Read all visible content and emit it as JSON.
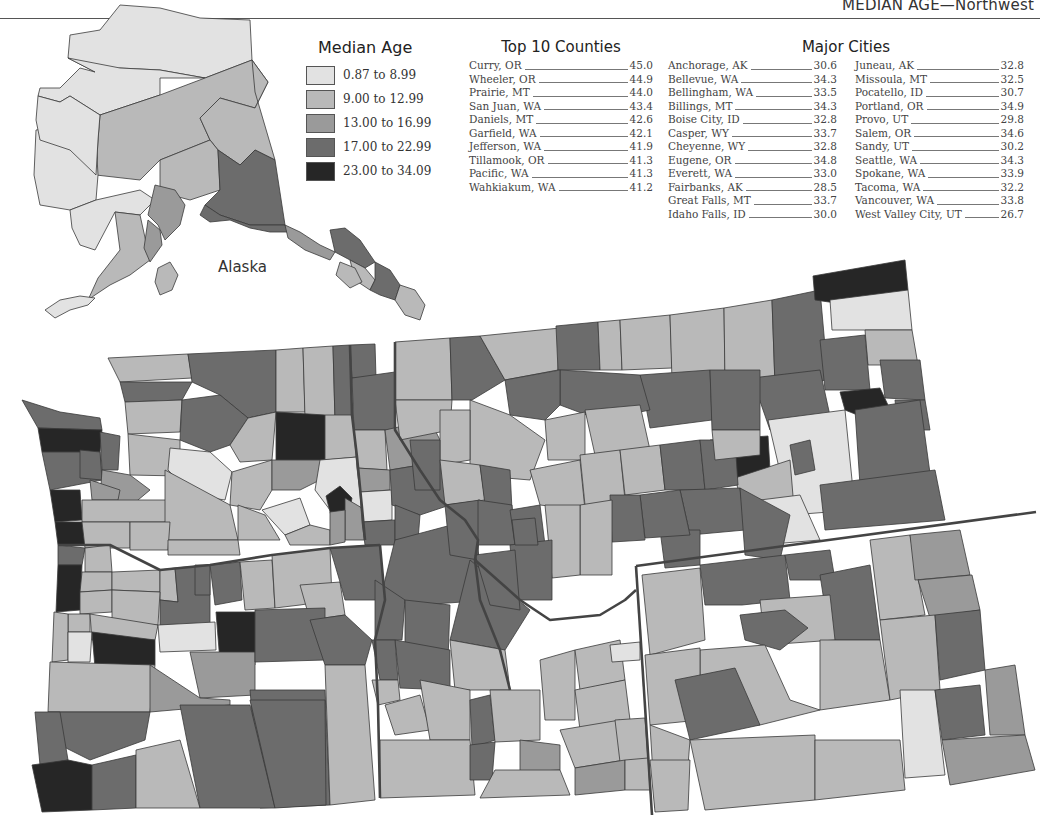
{
  "header": {
    "title": "MEDIAN AGE—Northwest"
  },
  "legend": {
    "title": "Median Age",
    "classes": [
      {
        "label": "0.87 to 8.99",
        "color": "#e2e2e2"
      },
      {
        "label": "9.00 to 12.99",
        "color": "#b9b9b9"
      },
      {
        "label": "13.00 to 16.99",
        "color": "#9a9a9a"
      },
      {
        "label": "17.00 to 22.99",
        "color": "#6c6c6c"
      },
      {
        "label": "23.00 to 34.09",
        "color": "#262626"
      }
    ]
  },
  "top_counties": {
    "title": "Top 10 Counties",
    "rows": [
      {
        "name": "Curry, OR",
        "value": "45.0"
      },
      {
        "name": "Wheeler, OR",
        "value": "44.9"
      },
      {
        "name": "Prairie, MT",
        "value": "44.0"
      },
      {
        "name": "San Juan, WA",
        "value": "43.4"
      },
      {
        "name": "Daniels, MT",
        "value": "42.6"
      },
      {
        "name": "Garfield, WA",
        "value": "42.1"
      },
      {
        "name": "Jefferson, WA",
        "value": "41.9"
      },
      {
        "name": "Tillamook, OR",
        "value": "41.3"
      },
      {
        "name": "Pacific, WA",
        "value": "41.3"
      },
      {
        "name": "Wahkiakum, WA",
        "value": "41.2"
      }
    ]
  },
  "major_cities": {
    "title": "Major Cities",
    "col1": [
      {
        "name": "Anchorage, AK",
        "value": "30.6"
      },
      {
        "name": "Bellevue, WA",
        "value": "34.3"
      },
      {
        "name": "Bellingham, WA",
        "value": "33.5"
      },
      {
        "name": "Billings, MT",
        "value": "34.3"
      },
      {
        "name": "Boise City, ID",
        "value": "32.8"
      },
      {
        "name": "Casper, WY",
        "value": "33.7"
      },
      {
        "name": "Cheyenne, WY",
        "value": "32.8"
      },
      {
        "name": "Eugene, OR",
        "value": "34.8"
      },
      {
        "name": "Everett, WA",
        "value": "33.0"
      },
      {
        "name": "Fairbanks, AK",
        "value": "28.5"
      },
      {
        "name": "Great Falls, MT",
        "value": "33.7"
      },
      {
        "name": "Idaho Falls, ID",
        "value": "30.0"
      }
    ],
    "col2": [
      {
        "name": "Juneau, AK",
        "value": "32.8"
      },
      {
        "name": "Missoula, MT",
        "value": "32.5"
      },
      {
        "name": "Pocatello, ID",
        "value": "30.7"
      },
      {
        "name": "Portland, OR",
        "value": "34.9"
      },
      {
        "name": "Provo, UT",
        "value": "29.8"
      },
      {
        "name": "Salem, OR",
        "value": "34.6"
      },
      {
        "name": "Sandy, UT",
        "value": "30.2"
      },
      {
        "name": "Seattle, WA",
        "value": "34.3"
      },
      {
        "name": "Spokane, WA",
        "value": "33.9"
      },
      {
        "name": "Tacoma, WA",
        "value": "32.2"
      },
      {
        "name": "Vancouver, WA",
        "value": "33.8"
      },
      {
        "name": "West Valley City, UT",
        "value": "26.7"
      }
    ]
  },
  "map": {
    "inset_label": "Alaska",
    "border_color": "#3a3a3a",
    "state_line_color": "#444444"
  }
}
